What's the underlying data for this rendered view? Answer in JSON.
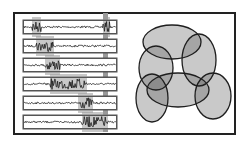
{
  "figure": {
    "width": 250,
    "height": 147,
    "frame": {
      "x": 14,
      "y": 13,
      "w": 221,
      "h": 121,
      "stroke": "#222222"
    },
    "colors": {
      "background": "#ffffff",
      "signal": "#1a1a1a",
      "strip_border": "#555555",
      "marker_fill": "#9a9a9a",
      "ellipse_fill": "#b3b3b3",
      "ellipse_stroke": "#1e1e1e"
    },
    "signal_panel": {
      "strip_x": 23,
      "strip_w": 94,
      "strip_h": 14,
      "strips": [
        {
          "y": 20,
          "bursts": [
            [
              32,
              41
            ],
            [
              103,
              110
            ]
          ]
        },
        {
          "y": 39,
          "bursts": [
            [
              36,
              54
            ]
          ]
        },
        {
          "y": 58,
          "bursts": [
            [
              45,
              60
            ]
          ]
        },
        {
          "y": 77,
          "bursts": [
            [
              50,
              87
            ]
          ]
        },
        {
          "y": 96,
          "bursts": [
            [
              78,
              93
            ]
          ]
        },
        {
          "y": 115,
          "bursts": [
            [
              82,
              108
            ]
          ]
        }
      ],
      "vertical_marker": {
        "x": 103,
        "w": 5
      }
    },
    "ellipse_panel": {
      "ellipses": [
        {
          "name": "top",
          "cx": 172,
          "cy": 42,
          "rx": 29,
          "ry": 17
        },
        {
          "name": "left-middle",
          "cx": 156,
          "cy": 68,
          "rx": 17,
          "ry": 22
        },
        {
          "name": "right-middle",
          "cx": 199,
          "cy": 60,
          "rx": 17,
          "ry": 26
        },
        {
          "name": "bottom",
          "cx": 178,
          "cy": 90,
          "rx": 31,
          "ry": 17
        },
        {
          "name": "bottom-left",
          "cx": 152,
          "cy": 98,
          "rx": 16,
          "ry": 24
        },
        {
          "name": "bottom-right",
          "cx": 213,
          "cy": 96,
          "rx": 18,
          "ry": 23
        }
      ]
    }
  }
}
